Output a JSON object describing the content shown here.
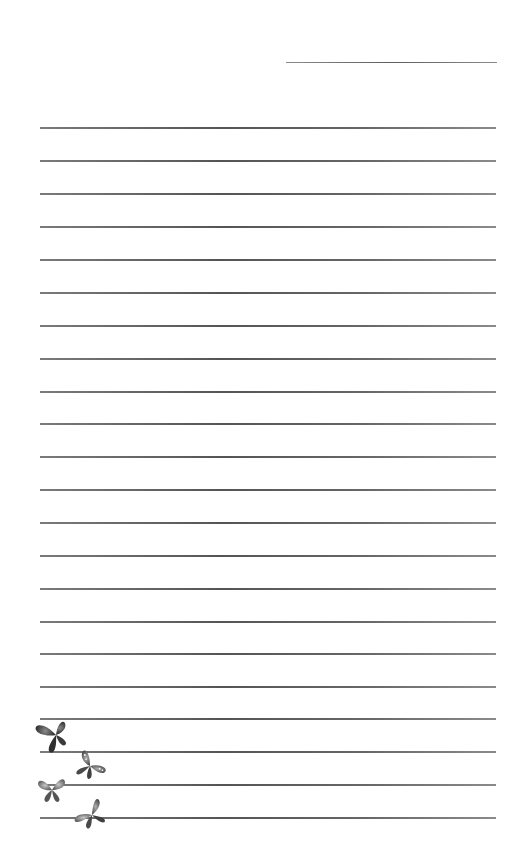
{
  "page": {
    "type": "lined-writing-paper",
    "background": "#ffffff",
    "line_color": "#5e5e5e"
  },
  "header": {
    "date_line": {
      "x": 286,
      "y": 62,
      "width": 211
    }
  },
  "ruled_lines": {
    "count": 22,
    "left": 40,
    "width": 456,
    "positions": [
      127,
      160,
      193,
      226,
      259,
      292,
      325,
      358,
      391,
      423,
      456,
      489,
      522,
      555,
      588,
      621,
      653,
      686,
      718,
      751,
      784,
      817
    ]
  },
  "decorations": {
    "butterflies": [
      {
        "name": "butterfly-dark-top",
        "x": 38,
        "y": 717,
        "rotation": -20,
        "color": "#3a3a3a"
      },
      {
        "name": "butterfly-spotted",
        "x": 72,
        "y": 748,
        "rotation": 15,
        "color": "#555555"
      },
      {
        "name": "butterfly-light-left",
        "x": 36,
        "y": 775,
        "rotation": 0,
        "color": "#6a6a6a"
      },
      {
        "name": "butterfly-bottom",
        "x": 72,
        "y": 795,
        "rotation": -10,
        "color": "#5a5a5a"
      }
    ]
  }
}
